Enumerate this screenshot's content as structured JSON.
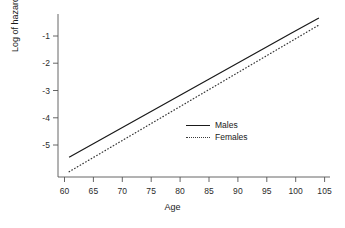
{
  "chart_data": {
    "type": "line",
    "title": "",
    "xlabel": "Age",
    "ylabel": "Log of hazard rate",
    "xlim": [
      58,
      107
    ],
    "ylim": [
      -6.1,
      0.1
    ],
    "xticks": [
      60,
      65,
      70,
      75,
      80,
      85,
      90,
      95,
      100,
      105
    ],
    "yticks": [
      -1,
      -2,
      -3,
      -4,
      -5
    ],
    "xtick_labels": [
      "60",
      "65",
      "70",
      "75",
      "80",
      "85",
      "90",
      "95",
      "100",
      "105"
    ],
    "ytick_labels": [
      "-1",
      "-2",
      "-3",
      "-4",
      "-5"
    ],
    "grid": false,
    "legend_position": "center-right",
    "x": [
      60,
      65,
      70,
      75,
      80,
      85,
      90,
      95,
      100,
      105
    ],
    "series": [
      {
        "name": "Males",
        "style": "solid",
        "color": "#1a1a1a",
        "values": [
          -5.35,
          -4.76,
          -4.17,
          -3.58,
          -2.99,
          -2.4,
          -1.81,
          -1.22,
          -0.63,
          -0.05
        ]
      },
      {
        "name": "Females",
        "style": "dotted",
        "color": "#3a3a3a",
        "values": [
          -5.9,
          -5.28,
          -4.66,
          -4.04,
          -3.42,
          -2.8,
          -2.18,
          -1.56,
          -0.94,
          -0.32
        ]
      }
    ]
  },
  "legend": {
    "items": [
      {
        "label": "Males",
        "style": "solid"
      },
      {
        "label": "Females",
        "style": "dotted"
      }
    ]
  },
  "axes": {
    "x_title": "Age",
    "y_title": "Log of hazard rate"
  }
}
